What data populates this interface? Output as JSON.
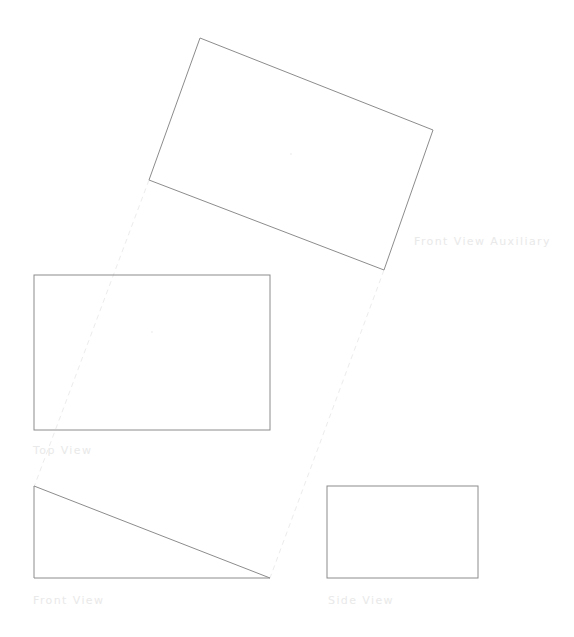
{
  "canvas": {
    "width": 574,
    "height": 637,
    "background_color": "#ffffff"
  },
  "style": {
    "solid_line_color": "#8c8c8c",
    "solid_line_width": 1,
    "dashed_line_color": "#ececec",
    "dashed_line_width": 1,
    "dash_pattern": "5,4",
    "label_color": "#e9e9e9",
    "center_dot_color": "#f0f0f0"
  },
  "labels": {
    "auxiliary": "Front View Auxiliary",
    "top": "Top View",
    "front": "Front View",
    "side": "Side View"
  },
  "views": {
    "auxiliary": {
      "name": "Front View Auxiliary",
      "shape": "rotated-rectangle",
      "points": "200,38 433,130 384,270 149,180",
      "center_dot": {
        "x": 291,
        "y": 154
      }
    },
    "top": {
      "name": "Top View",
      "shape": "rectangle",
      "x": 34,
      "y": 275,
      "width": 236,
      "height": 155,
      "center_dot": {
        "x": 152,
        "y": 332
      }
    },
    "front": {
      "name": "Front View",
      "shape": "right-triangle",
      "points": "34,486 34,578 270,578",
      "hypotenuse": "34,486 270,578"
    },
    "side": {
      "name": "Side View",
      "shape": "rectangle",
      "x": 327,
      "y": 486,
      "width": 151,
      "height": 92
    }
  },
  "projection_lines": [
    {
      "name": "auxiliary-to-front-left",
      "x1": 149,
      "y1": 180,
      "x2": 34,
      "y2": 487
    },
    {
      "name": "auxiliary-to-front-right",
      "x1": 384,
      "y1": 270,
      "x2": 270,
      "y2": 578
    }
  ]
}
